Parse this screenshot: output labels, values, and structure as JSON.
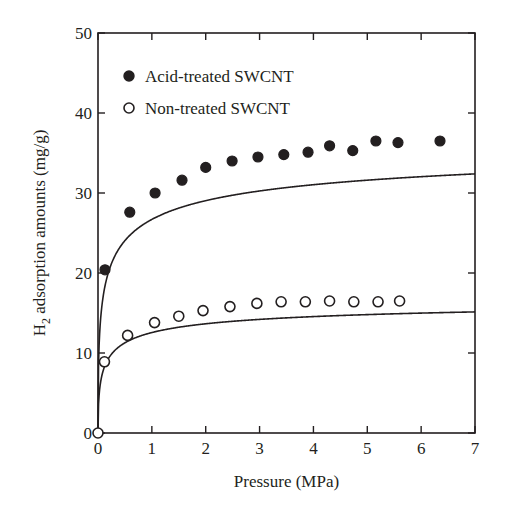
{
  "chart_data": {
    "type": "scatter",
    "title": "",
    "xlabel": "Pressure (MPa)",
    "ylabel": "H2 adsorption amounts (mg/g)",
    "ylabel_parts": {
      "prefix": "H",
      "subscript": "2",
      "suffix": " adsorption amounts (mg/g)"
    },
    "xlim": [
      0,
      7
    ],
    "ylim": [
      0,
      50
    ],
    "xticks": [
      0,
      1,
      2,
      3,
      4,
      5,
      6,
      7
    ],
    "yticks": [
      0,
      10,
      20,
      30,
      40,
      50
    ],
    "grid": false,
    "legend_position": "upper left (inside)",
    "series": [
      {
        "name": "Acid-treated SWCNT",
        "marker": "filled-circle",
        "color": "#231f20",
        "x": [
          0.13,
          0.59,
          1.06,
          1.56,
          2.0,
          2.49,
          2.97,
          3.45,
          3.9,
          4.3,
          4.73,
          5.16,
          5.57,
          6.35
        ],
        "y": [
          20.4,
          27.6,
          30.0,
          31.6,
          33.2,
          34.0,
          34.5,
          34.8,
          35.1,
          35.9,
          35.3,
          36.5,
          36.3,
          36.5
        ],
        "fit_curve": "Langmuir-type, saturating near 36.7"
      },
      {
        "name": "Non-treated SWCNT",
        "marker": "open-circle",
        "color": "#231f20",
        "x": [
          0.0,
          0.12,
          0.55,
          1.05,
          1.5,
          1.95,
          2.45,
          2.95,
          3.4,
          3.85,
          4.3,
          4.75,
          5.2,
          5.6
        ],
        "y": [
          0.0,
          8.9,
          12.2,
          13.8,
          14.6,
          15.3,
          15.8,
          16.2,
          16.4,
          16.4,
          16.5,
          16.4,
          16.4,
          16.5
        ],
        "fit_curve": "Langmuir-type, saturating near 16.6"
      }
    ]
  },
  "legend": {
    "items": [
      {
        "label": "Acid-treated SWCNT",
        "marker": "filled-circle"
      },
      {
        "label": "Non-treated SWCNT",
        "marker": "open-circle"
      }
    ]
  },
  "axes": {
    "x_title": "Pressure (MPa)",
    "y_title_prefix": "H",
    "y_title_sub": "2",
    "y_title_suffix": " adsorption amounts (mg/g)",
    "x_tick_labels": [
      "0",
      "1",
      "2",
      "3",
      "4",
      "5",
      "6",
      "7"
    ],
    "y_tick_labels": [
      "0",
      "10",
      "20",
      "30",
      "40",
      "50"
    ]
  },
  "colors": {
    "ink": "#231f20",
    "background": "#ffffff"
  }
}
